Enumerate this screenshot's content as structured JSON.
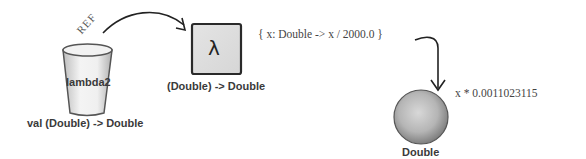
{
  "diagram": {
    "variable": {
      "name": "lambda2",
      "type_label": "val (Double) -> Double",
      "ref_label": "REF"
    },
    "lambda_object": {
      "symbol": "λ",
      "type_label": "(Double) -> Double",
      "code": "{ x: Double -> x / 2000.0 }"
    },
    "result_object": {
      "type_label": "Double",
      "expression": "x * 0.0011023115"
    }
  }
}
